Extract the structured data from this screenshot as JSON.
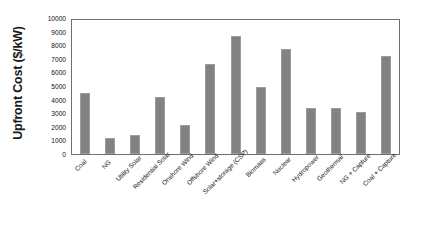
{
  "chart_data": {
    "type": "bar",
    "title": "",
    "xlabel": "",
    "ylabel": "Upfront Cost ($/kW)",
    "ylim": [
      0,
      10000
    ],
    "ytick_step": 1000,
    "grid": false,
    "legend": null,
    "bar_color": "#828282",
    "axis_color": "#6f6f6f",
    "categories": [
      "Coal",
      "NG",
      "Utility Solar",
      "Residential Solar",
      "Onshore Wind",
      "Offshore Wind",
      "Solar+storage (CSP)",
      "Biomass",
      "Nuclear",
      "Hydropower",
      "Geothermal",
      "NG + Capture",
      "Coal + Capture"
    ],
    "values": [
      4450,
      1150,
      1400,
      4200,
      2100,
      6600,
      8700,
      4950,
      7700,
      3400,
      3350,
      3100,
      7200
    ],
    "ytick_labels": [
      "10000",
      "9000",
      "8000",
      "7000",
      "6000",
      "5000",
      "4000",
      "3000",
      "2000",
      "1000",
      "0"
    ],
    "ytick_values": [
      10000,
      9000,
      8000,
      7000,
      6000,
      5000,
      4000,
      3000,
      2000,
      1000,
      0
    ]
  }
}
